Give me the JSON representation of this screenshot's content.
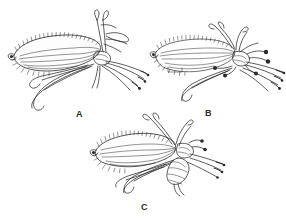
{
  "figure": {
    "type": "scientific-illustration-plate",
    "background_color": "#ffffff",
    "ink_color": "#2a2a2a",
    "panel_count": 3
  },
  "panels": [
    {
      "id": "A",
      "label": "A",
      "label_x": 76,
      "label_y": 110,
      "drawing_name": "insect-specimen-a",
      "description": "insect with long fringed wing pointing left, antennae up-right, legs splayed lower-right"
    },
    {
      "id": "B",
      "label": "B",
      "label_x": 205,
      "label_y": 109,
      "drawing_name": "insect-specimen-b",
      "description": "insect with fringed wing pointing left, dark tipped palps, legs extending right"
    },
    {
      "id": "C",
      "label": "C",
      "label_x": 141,
      "label_y": 203,
      "drawing_name": "insect-specimen-c",
      "description": "insect with fringed wing pointing left, segmented abdomen visible, legs to the right"
    }
  ]
}
